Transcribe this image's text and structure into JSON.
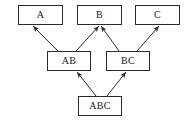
{
  "diagram": {
    "background_color": "#fefefe",
    "line_color": "#2b2b2b",
    "box_fill": "#ffffff",
    "nodes": [
      {
        "id": "A",
        "label": "A",
        "x": 18,
        "y": 5,
        "w": 45,
        "h": 20,
        "level": "top"
      },
      {
        "id": "B",
        "label": "B",
        "x": 77,
        "y": 5,
        "w": 45,
        "h": 20,
        "level": "top"
      },
      {
        "id": "C",
        "label": "C",
        "x": 135,
        "y": 5,
        "w": 45,
        "h": 20,
        "level": "top"
      },
      {
        "id": "AB",
        "label": "AB",
        "x": 47,
        "y": 51,
        "w": 44,
        "h": 20,
        "level": "middle"
      },
      {
        "id": "BC",
        "label": "BC",
        "x": 106,
        "y": 51,
        "w": 44,
        "h": 20,
        "level": "middle"
      },
      {
        "id": "ABC",
        "label": "ABC",
        "x": 78,
        "y": 96,
        "w": 44,
        "h": 20,
        "level": "bottom"
      }
    ],
    "edges": [
      {
        "id": "ab-to-a",
        "from": "AB",
        "to": "A",
        "x1": 58,
        "y1": 51,
        "x2": 33,
        "y2": 26,
        "arrow": "up-left"
      },
      {
        "id": "ab-to-b",
        "from": "AB",
        "to": "B",
        "x1": 76,
        "y1": 51,
        "x2": 99,
        "y2": 26,
        "arrow": "up-right"
      },
      {
        "id": "bc-to-b",
        "from": "BC",
        "to": "B",
        "x1": 119,
        "y1": 51,
        "x2": 101,
        "y2": 26,
        "arrow": "up-left"
      },
      {
        "id": "bc-to-c",
        "from": "BC",
        "to": "C",
        "x1": 137,
        "y1": 51,
        "x2": 159,
        "y2": 26,
        "arrow": "up-right"
      },
      {
        "id": "abc-to-ab",
        "from": "ABC",
        "to": "AB",
        "x1": 96,
        "y1": 96,
        "x2": 77,
        "y2": 72,
        "arrow": "up-left"
      },
      {
        "id": "abc-to-bc",
        "from": "ABC",
        "to": "BC",
        "x1": 107,
        "y1": 96,
        "x2": 126,
        "y2": 72,
        "arrow": "up-right"
      }
    ]
  }
}
